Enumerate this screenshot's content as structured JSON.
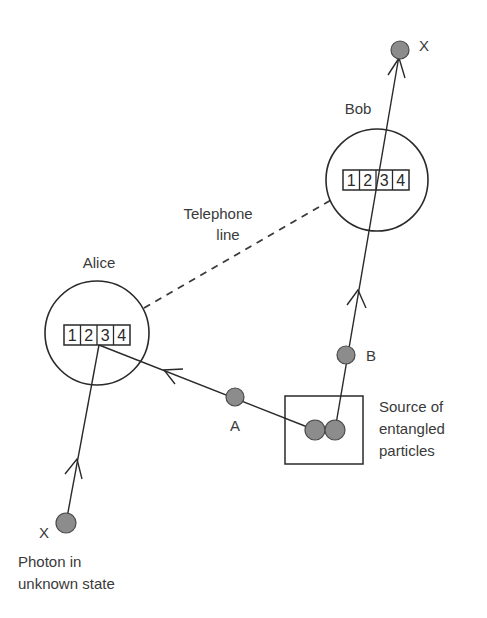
{
  "diagram": {
    "colors": {
      "line": "#2a2a2a",
      "particle_fill": "#8c8c8c",
      "text": "#3a3a3a",
      "background": "#ffffff"
    },
    "nodes": {
      "bob": {
        "label": "Bob",
        "register": [
          "1",
          "2",
          "3",
          "4"
        ]
      },
      "alice": {
        "label": "Alice",
        "register": [
          "1",
          "2",
          "3",
          "4"
        ]
      },
      "source": {
        "label_lines": [
          "Source of",
          "entangled",
          "particles"
        ]
      }
    },
    "particles": {
      "x_top": {
        "label": "X"
      },
      "x_bottom": {
        "label": "X"
      },
      "a": {
        "label": "A"
      },
      "b": {
        "label": "B"
      }
    },
    "channels": {
      "telephone": {
        "label_lines": [
          "Telephone",
          "line"
        ],
        "style": "dashed"
      }
    },
    "caption": {
      "lines": [
        "Photon in",
        "unknown state"
      ]
    }
  }
}
